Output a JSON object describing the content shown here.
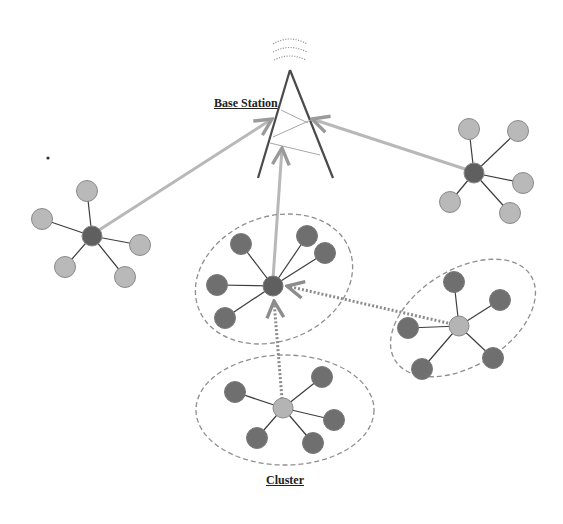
{
  "labels": {
    "base_station": "Base Station",
    "cluster": "Cluster"
  },
  "colors": {
    "background": "#ffffff",
    "head_node_dark": "#5f5f5f",
    "head_node_light": "#b4b4b4",
    "member_dark": "#6f6f6f",
    "member_light": "#b9b9b9",
    "node_stroke": "#8a8a8a",
    "link": "#3d3d3d",
    "uplink": "#b8b8b8",
    "dotted_link": "#8c8c8c",
    "cluster_boundary": "#8f8f8f",
    "tower": "#4a4a4a"
  },
  "diagram": {
    "nodes": [
      {
        "id": "left-star",
        "hub": [
          92,
          236
        ],
        "hub_tone": "dark",
        "leaf_tone": "light",
        "leaves": [
          [
            87,
            191
          ],
          [
            42,
            219
          ],
          [
            140,
            245
          ],
          [
            65,
            267
          ],
          [
            125,
            277
          ]
        ]
      },
      {
        "id": "right-star",
        "hub": [
          474,
          173
        ],
        "hub_tone": "dark",
        "leaf_tone": "light",
        "leaves": [
          [
            469,
            129
          ],
          [
            518,
            131
          ],
          [
            523,
            183
          ],
          [
            450,
            202
          ],
          [
            510,
            213
          ]
        ]
      },
      {
        "id": "middle-cluster",
        "hub": [
          273,
          286
        ],
        "hub_tone": "dark",
        "leaf_tone": "dark",
        "leaves": [
          [
            241,
            244
          ],
          [
            307,
            236
          ],
          [
            325,
            253
          ],
          [
            217,
            285
          ],
          [
            225,
            318
          ]
        ]
      },
      {
        "id": "right-cluster",
        "hub": [
          459,
          326
        ],
        "hub_tone": "light",
        "leaf_tone": "dark",
        "leaves": [
          [
            454,
            282
          ],
          [
            500,
            300
          ],
          [
            408,
            328
          ],
          [
            493,
            358
          ],
          [
            422,
            369
          ]
        ]
      },
      {
        "id": "bottom-cluster",
        "hub": [
          283,
          408
        ],
        "hub_tone": "light",
        "leaf_tone": "dark",
        "leaves": [
          [
            235,
            392
          ],
          [
            322,
            377
          ],
          [
            334,
            420
          ],
          [
            257,
            438
          ],
          [
            313,
            443
          ]
        ]
      }
    ],
    "uplinks": [
      {
        "from": "left-star",
        "to": "base-station"
      },
      {
        "from": "right-star",
        "to": "base-station"
      },
      {
        "from": "middle-cluster",
        "to": "base-station"
      }
    ],
    "relay_links": [
      {
        "from": "right-cluster",
        "to": "middle-cluster",
        "style": "dotted"
      },
      {
        "from": "bottom-cluster",
        "to": "middle-cluster",
        "style": "dotted"
      }
    ]
  }
}
